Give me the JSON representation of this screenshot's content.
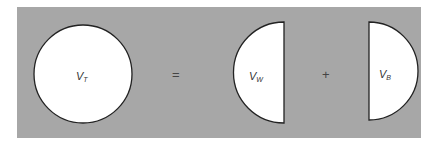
{
  "diagram": {
    "background_color": "#a7a7a7",
    "shape_fill": "#ffffff",
    "stroke_color": "#222222",
    "terms": [
      {
        "name": "total-sphere",
        "label": "V",
        "subscript": "T"
      },
      {
        "name": "operator-equals",
        "symbol": "="
      },
      {
        "name": "water-segment",
        "label": "V",
        "subscript": "W"
      },
      {
        "name": "operator-plus",
        "symbol": "+"
      },
      {
        "name": "b-segment",
        "label": "V",
        "subscript": "B"
      }
    ]
  }
}
